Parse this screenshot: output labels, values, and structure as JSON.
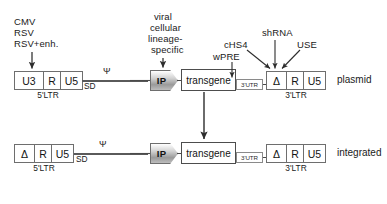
{
  "annotations": {
    "promoter": {
      "line1": "CMV",
      "line2": "RSV",
      "line3": "RSV+enh."
    },
    "internal_promoter": {
      "line1": "viral",
      "line2": "cellular",
      "line3": "lineage-",
      "line4": "specific"
    },
    "elements": {
      "shrna": "shRNA",
      "chs4": "cHS4",
      "use": "USE",
      "wpre": "wPRE"
    }
  },
  "rows": {
    "plasmid": {
      "side_label": "plasmid",
      "five_ltr": {
        "caption": "5'LTR",
        "segments": [
          {
            "label": "U3"
          },
          {
            "label": "R"
          },
          {
            "label": "U5"
          }
        ]
      },
      "packaging": {
        "psi": "Ψ",
        "sd": "SD"
      },
      "ip": {
        "label": "IP"
      },
      "transgene": {
        "label": "transgene"
      },
      "utr": {
        "label": "3'UTR"
      },
      "three_ltr": {
        "caption": "3'LTR",
        "segments": [
          {
            "label": "Δ"
          },
          {
            "label": "R"
          },
          {
            "label": "U5"
          }
        ]
      }
    },
    "integrated": {
      "side_label": "integrated",
      "five_ltr": {
        "caption": "5'LTR",
        "segments": [
          {
            "label": "Δ"
          },
          {
            "label": "R"
          },
          {
            "label": "U5"
          }
        ]
      },
      "packaging": {
        "psi": "Ψ",
        "sd": "SD"
      },
      "ip": {
        "label": "IP"
      },
      "transgene": {
        "label": "transgene"
      },
      "utr": {
        "label": "3'UTR"
      },
      "three_ltr": {
        "caption": "3'LTR",
        "segments": [
          {
            "label": "Δ"
          },
          {
            "label": "R"
          },
          {
            "label": "U5"
          }
        ]
      }
    }
  },
  "colors": {
    "stroke": "#4a4a4a",
    "box_border": "#6e6e6e",
    "text": "#1a1a1a",
    "background": "#ffffff"
  }
}
